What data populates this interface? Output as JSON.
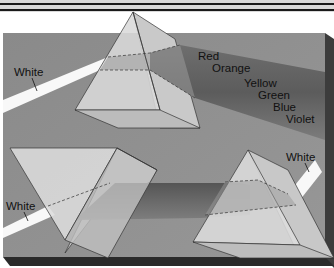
{
  "figure": {
    "colors": {
      "header_band": "#d9d9d9",
      "header_rule": "#1a1a1a",
      "board": "#8f8f8f",
      "board_side": "#3c3c3c",
      "board_bottom": "#2a2a2a",
      "prism_face": "#dcdcdc",
      "prism_side": "#c4c4c4",
      "white_beam": "#f8f8f8",
      "spectrum_dark": "#5a5a5a",
      "spectrum_light": "#7a7a7a",
      "label_text": "#111111"
    },
    "top_prism": {
      "incoming_label": "White",
      "spectrum_labels": [
        "Red",
        "Orange",
        "Yellow",
        "Green",
        "Blue",
        "Violet"
      ]
    },
    "bottom_left_prism": {
      "incoming_label": "White"
    },
    "bottom_right_prism": {
      "outgoing_label": "White"
    }
  }
}
